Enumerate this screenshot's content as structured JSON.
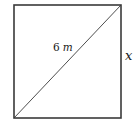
{
  "diagram": {
    "shape": "square",
    "diagonal_label": "6",
    "diagonal_unit": "m",
    "side_label": "x",
    "stroke_color": "#3a3a3a",
    "text_color": "#1a1a1a"
  }
}
